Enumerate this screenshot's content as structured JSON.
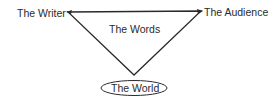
{
  "diagram": {
    "type": "rhetorical-triangle",
    "nodes": {
      "writer": "The Writer",
      "audience": "The Audience",
      "words": "The Words",
      "world": "The World"
    },
    "edges": [
      {
        "from": "The Writer",
        "to": "The Audience"
      },
      {
        "from": "The Writer",
        "to": "The World"
      },
      {
        "from": "The Audience",
        "to": "The World"
      }
    ],
    "line_color": "#2a2a2a"
  }
}
